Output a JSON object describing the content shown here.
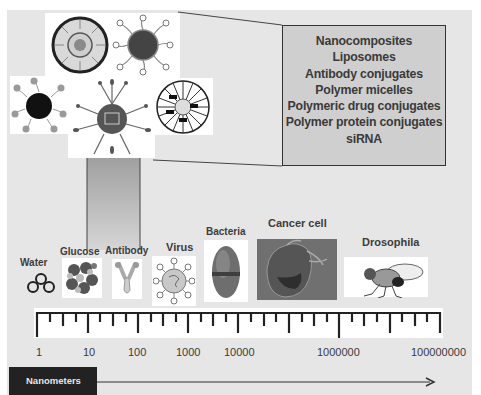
{
  "carriers_box": {
    "items": [
      "Nanocomposites",
      "Liposomes",
      "Antibody conjugates",
      "Polymer micelles",
      "Polymeric drug conjugates",
      "Polymer protein conjugates",
      "siRNA"
    ]
  },
  "nanocarrier_icons": [
    "liposome-icon",
    "dendrimer-nanoparticle-icon",
    "ligand-coated-nanoparticle-icon",
    "targeted-nanoparticle-icon",
    "polymer-micelle-icon"
  ],
  "objects": [
    {
      "label": "Water",
      "icon": "water-molecule-icon"
    },
    {
      "label": "Glucose",
      "icon": "glucose-molecule-icon"
    },
    {
      "label": "Antibody",
      "icon": "antibody-icon"
    },
    {
      "label": "Virus",
      "icon": "virus-icon"
    },
    {
      "label": "Bacteria",
      "icon": "bacteria-icon"
    },
    {
      "label": "Cancer cell",
      "icon": "cancer-cell-icon"
    },
    {
      "label": "Drosophila",
      "icon": "fruit-fly-icon"
    }
  ],
  "scale": {
    "tick_labels": [
      "1",
      "10",
      "100",
      "1000",
      "10000",
      "1000000",
      "100000000"
    ],
    "unit_label": "Nanometers"
  },
  "colors": {
    "background": "#e6e6e6",
    "box_fill": "#cfcfcf",
    "text": "#3a3a3a",
    "unit_bar": "#222222"
  }
}
